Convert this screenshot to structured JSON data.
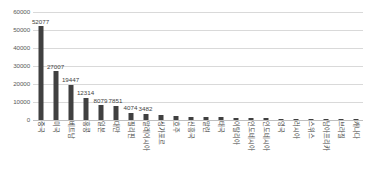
{
  "chart_data": {
    "type": "bar",
    "title": "",
    "xlabel": "",
    "ylabel": "",
    "ylim": [
      0,
      60000
    ],
    "grid": true,
    "legend": false,
    "y_ticks": [
      60000,
      50000,
      40000,
      30000,
      20000,
      10000,
      0
    ],
    "y_tick_labels": [
      "60000",
      "50000",
      "40000",
      "30000",
      "20000",
      "10000",
      "0"
    ],
    "categories": [
      "중국",
      "미국",
      "베트남",
      "홍콩",
      "일본",
      "대만",
      "필리핀",
      "말레이시아",
      "싱가포르",
      "호주",
      "신흥국",
      "말련",
      "태국",
      "이탈리아",
      "인도네시아",
      "인도네시아",
      "영국",
      "러시아",
      "스위스",
      "남아프리카",
      "브라질",
      "캐나다"
    ],
    "values": [
      52077,
      27007,
      19447,
      12314,
      8079,
      7851,
      4074,
      3482,
      2600,
      2300,
      1900,
      1600,
      1400,
      1200,
      1000,
      900,
      800,
      700,
      600,
      500,
      420,
      330
    ],
    "value_labels": [
      "52077",
      "27007",
      "19447",
      "12314",
      "8079",
      "7851",
      "4074",
      "3482",
      "",
      "",
      "",
      "",
      "",
      "",
      "",
      "",
      "",
      "",
      "",
      "",
      "",
      ""
    ],
    "bar_color": "#404040",
    "gridline_color": "#d9d9d9",
    "axis_color": "#bfbfbf"
  }
}
